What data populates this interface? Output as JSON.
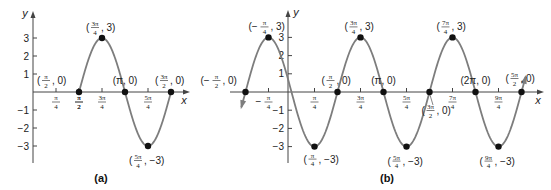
{
  "chart_data": [
    {
      "type": "line",
      "panel_label": "(a)",
      "function_shape": "y = -3 sin(2x), one period from π/2 to 3π/2",
      "xlabel": "x",
      "ylabel": "y",
      "x_ticks": [
        "π/4",
        "π/2",
        "3π/4",
        "5π/4"
      ],
      "y_ticks": [
        3,
        2,
        1,
        -1,
        -2,
        -3
      ],
      "ylim": [
        -3,
        3
      ],
      "x_range": [
        "0",
        "3π/2"
      ],
      "points": [
        {
          "x": "π/2",
          "y": 0,
          "label": "(π/2, 0)"
        },
        {
          "x": "3π/4",
          "y": 3,
          "label": "(3π/4, 3)"
        },
        {
          "x": "π",
          "y": 0,
          "label": "(π, 0)"
        },
        {
          "x": "5π/4",
          "y": -3,
          "label": "(5π/4, −3)"
        },
        {
          "x": "3π/2",
          "y": 0,
          "label": "(3π/2, 0)"
        }
      ]
    },
    {
      "type": "line",
      "panel_label": "(b)",
      "function_shape": "y = -3 sin(2x), extended from -π/2 to 5π/2 with arrows",
      "xlabel": "x",
      "ylabel": "y",
      "x_ticks": [
        "−π/4",
        "π/4",
        "3π/4",
        "5π/4",
        "7π/4",
        "9π/4"
      ],
      "y_ticks": [
        3,
        2,
        1,
        -1,
        -2,
        -3
      ],
      "ylim": [
        -3,
        3
      ],
      "x_range": [
        "−π/2",
        "5π/2"
      ],
      "points": [
        {
          "x": "−π/2",
          "y": 0,
          "label": "(−π/2, 0)"
        },
        {
          "x": "−π/4",
          "y": 3,
          "label": "(−π/4, 3)"
        },
        {
          "x": "π/4",
          "y": -3,
          "label": "(π/4, −3)"
        },
        {
          "x": "π/2",
          "y": 0,
          "label": "(π/2, 0)"
        },
        {
          "x": "3π/4",
          "y": 3,
          "label": "(3π/4, 3)"
        },
        {
          "x": "π",
          "y": 0,
          "label": "(π, 0)"
        },
        {
          "x": "5π/4",
          "y": -3,
          "label": "(5π/4, −3)"
        },
        {
          "x": "3π/2",
          "y": 0,
          "label": "(3π/2, 0)"
        },
        {
          "x": "7π/4",
          "y": 3,
          "label": "(7π/4, 3)"
        },
        {
          "x": "2π",
          "y": 0,
          "label": "(2π, 0)"
        },
        {
          "x": "9π/4",
          "y": -3,
          "label": "(9π/4, −3)"
        },
        {
          "x": "5π/2",
          "y": 0,
          "label": "(5π/2, 0)"
        }
      ]
    }
  ],
  "colors": {
    "curve": "#7d7d7d",
    "axis": "#444444",
    "points": "#111111",
    "text": "#222222"
  },
  "captions": {
    "a": "(a)",
    "b": "(b)"
  },
  "axis_labels": {
    "x": "x",
    "y": "y"
  }
}
